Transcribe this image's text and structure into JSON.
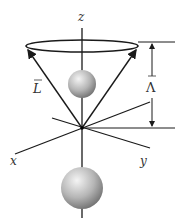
{
  "diagram": {
    "labels": {
      "z_axis": "z",
      "x_axis": "x",
      "y_axis": "y",
      "angular_momentum": "L",
      "projection": "Λ"
    },
    "colors": {
      "line": "#1a1a1a",
      "sphere_light": "#f2f2f2",
      "sphere_dark": "#6e6e6e",
      "label": "#333333"
    }
  }
}
